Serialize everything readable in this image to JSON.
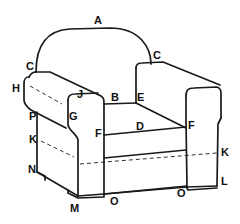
{
  "diagram": {
    "labels": {
      "A": "A",
      "B": "B",
      "C_left": "C",
      "C_right": "C",
      "D": "D",
      "E": "E",
      "F_left": "F",
      "F_right": "F",
      "G": "G",
      "H": "H",
      "J": "J",
      "K_left": "K",
      "K_right": "K",
      "L": "L",
      "M": "M",
      "N": "N",
      "O_left": "O",
      "O_right": "O",
      "P": "P"
    },
    "colors": {
      "line": "#1a1a1a",
      "background": "#ffffff"
    }
  }
}
